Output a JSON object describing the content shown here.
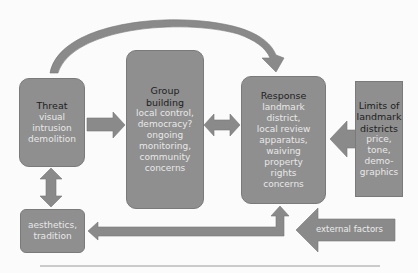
{
  "colors": {
    "box_fill": "#8f8f8f",
    "arrow_fill": "#8a8a8a",
    "title_text": "#1e1e1e",
    "body_text": "#e8e8e8",
    "background": "#fbfbfb"
  },
  "nodes": {
    "threat": {
      "title": "Threat",
      "lines": [
        "visual",
        "intrusion",
        "demolition"
      ]
    },
    "group_building": {
      "title_lines": [
        "Group",
        "building"
      ],
      "lines": [
        "local control,",
        "democracy?",
        "ongoing",
        "monitoring,",
        "community",
        "concerns"
      ]
    },
    "response": {
      "title": "Response",
      "lines": [
        "landmark",
        "district,",
        "local review",
        "apparatus,",
        "waiving",
        "property",
        "rights",
        "concerns"
      ]
    },
    "limits": {
      "title_lines": [
        "Limits of",
        "landmark",
        "districts"
      ],
      "lines": [
        "price,",
        "tone,",
        "demo-",
        "graphics"
      ]
    },
    "aesthetics": {
      "lines": [
        "aesthetics,",
        "tradition"
      ]
    }
  },
  "external_factors": {
    "label": "external factors"
  },
  "edges": [
    {
      "from": "threat",
      "to": "response",
      "type": "curved-arrow"
    },
    {
      "from": "threat",
      "to": "group_building",
      "type": "arrow"
    },
    {
      "from": "group_building",
      "to": "response",
      "type": "double-arrow"
    },
    {
      "from": "limits",
      "to": "response",
      "type": "arrow"
    },
    {
      "from": "threat",
      "to": "aesthetics",
      "type": "double-arrow"
    },
    {
      "from": "response",
      "to": "aesthetics",
      "type": "elbow-double-arrow"
    },
    {
      "from": "external_factors",
      "to": "response",
      "type": "arrow"
    }
  ]
}
